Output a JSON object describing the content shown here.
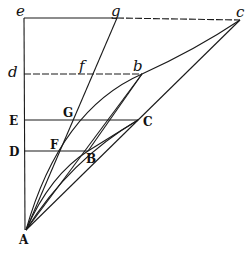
{
  "figure": {
    "points": {
      "A": {
        "label": "A",
        "x": 26,
        "y": 230
      },
      "B": {
        "label": "B",
        "x": 88,
        "y": 151
      },
      "C": {
        "label": "C",
        "x": 138,
        "y": 120
      },
      "D": {
        "label": "D",
        "x": 24,
        "y": 151
      },
      "E": {
        "label": "E",
        "x": 24,
        "y": 120
      },
      "F": {
        "label": "F",
        "x": 56,
        "y": 151
      },
      "G": {
        "label": "G",
        "x": 71,
        "y": 120
      },
      "b": {
        "label": "b",
        "x": 142,
        "y": 74
      },
      "c": {
        "label": "c",
        "x": 240,
        "y": 20
      },
      "d": {
        "label": "d",
        "x": 24,
        "y": 74
      },
      "e": {
        "label": "e",
        "x": 24,
        "y": 18
      },
      "f": {
        "label": "f",
        "x": 93,
        "y": 74
      },
      "g": {
        "label": "g",
        "x": 117,
        "y": 18
      }
    }
  }
}
